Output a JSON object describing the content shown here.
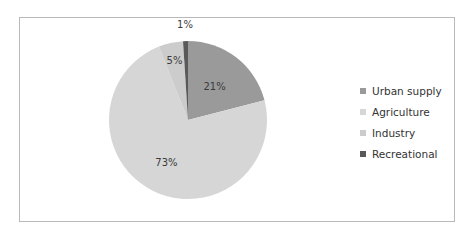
{
  "chart_data": {
    "type": "pie",
    "title": "",
    "categories": [
      "Urban supply",
      "Agriculture",
      "Industry",
      "Recreational"
    ],
    "values": [
      21,
      73,
      5,
      1
    ],
    "labels": [
      "21%",
      "73%",
      "5%",
      "1%"
    ],
    "colors": [
      "#9a9a9a",
      "#d6d6d6",
      "#cccccc",
      "#595959"
    ],
    "start_angle_deg": 0,
    "direction": "clockwise",
    "legend_position": "right"
  },
  "legend": {
    "items": [
      {
        "label": "Urban supply",
        "color": "#9a9a9a"
      },
      {
        "label": "Agriculture",
        "color": "#d6d6d6"
      },
      {
        "label": "Industry",
        "color": "#cccccc"
      },
      {
        "label": "Recreational",
        "color": "#595959"
      }
    ]
  }
}
